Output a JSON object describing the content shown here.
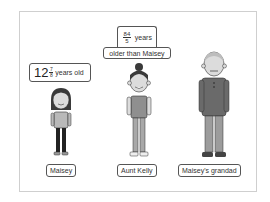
{
  "maisey": {
    "age_label": {
      "whole": "12",
      "numerator": "7",
      "denominator": "8",
      "suffix": "years old"
    },
    "name": "Maisey"
  },
  "aunt_kelly": {
    "difference_label": {
      "numerator": "84",
      "denominator": "5",
      "suffix": "years",
      "line2": "older than Maisey"
    },
    "name": "Aunt Kelly"
  },
  "grandad": {
    "name": "Maisey's grandad"
  },
  "colors": {
    "border": "#555555",
    "frame": "#cfcfcf",
    "shirt_girl": "#b9b9b9",
    "shirt_aunt": "#8f8f8f",
    "shirt_grandad": "#6a6a6a",
    "hair": "#3a3a3a",
    "skin": "#d9d9d9"
  }
}
